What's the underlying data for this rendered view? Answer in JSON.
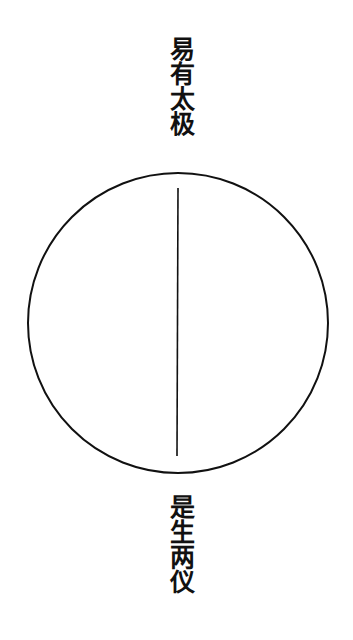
{
  "diagram": {
    "top_label": "易有太极",
    "bottom_label": "是生两仪",
    "circle": {
      "cx": 178,
      "cy": 323,
      "r": 150,
      "stroke": "#111111",
      "stroke_width": 2
    },
    "line": {
      "x1": 178,
      "y1": 188,
      "x2": 177,
      "y2": 456,
      "stroke": "#111111",
      "stroke_width": 1.6
    }
  }
}
